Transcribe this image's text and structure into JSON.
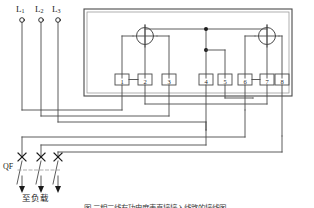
{
  "diagram": {
    "caption": "图  三相三线有功电度表直接接入线路的接线图",
    "line_color": "#4a4a4a",
    "text_color": "#1a1a1a",
    "background": "#ffffff"
  },
  "supply": {
    "phase_labels": [
      {
        "name": "L1",
        "base": "L",
        "sub": "1"
      },
      {
        "name": "L2",
        "base": "L",
        "sub": "2"
      },
      {
        "name": "L3",
        "base": "L",
        "sub": "3"
      }
    ]
  },
  "meter": {
    "name": "three-phase-three-wire-watt-hour-meter",
    "elements": [
      {
        "name": "measuring-element-1",
        "symbol": "circle-with-cross"
      },
      {
        "name": "measuring-element-2",
        "symbol": "circle-with-cross"
      }
    ],
    "terminals": [
      {
        "id": "1",
        "label": "1"
      },
      {
        "id": "2",
        "label": "2"
      },
      {
        "id": "3",
        "label": "3"
      },
      {
        "id": "4",
        "label": "4"
      },
      {
        "id": "5",
        "label": "5"
      },
      {
        "id": "6",
        "label": "6"
      },
      {
        "id": "7",
        "label": "7"
      },
      {
        "id": "8",
        "label": "8"
      }
    ],
    "jumpers": [
      {
        "from": "1",
        "to": "2"
      },
      {
        "from": "6",
        "to": "7"
      }
    ]
  },
  "breaker": {
    "label": "QF",
    "poles": 3,
    "symbol": "circuit-breaker-3-pole"
  },
  "load": {
    "label": "至负载"
  }
}
